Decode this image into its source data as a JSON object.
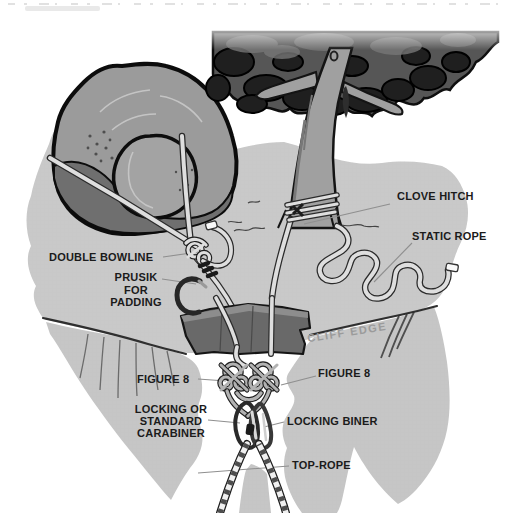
{
  "figure": {
    "labels": {
      "clove_hitch": "CLOVE HITCH",
      "static_rope": "STATIC ROPE",
      "double_bowline": "DOUBLE BOWLINE",
      "prusik": {
        "line1": "PRUSIK",
        "line2": "FOR",
        "line3": "PADDING"
      },
      "cliff_edge": "CLIFF EDGE",
      "figure8_left": "FIGURE 8",
      "figure8_right": "FIGURE 8",
      "carabiner": {
        "line1": "LOCKING OR",
        "line2": "STANDARD",
        "line3": "CARABINER"
      },
      "locking_biner": "LOCKING BINER",
      "top_rope": "TOP-ROPE"
    }
  },
  "colors": {
    "background": "#ffffff",
    "ground": "#c9c9c9",
    "cliff": "#c6c6c6",
    "boulder": "#9b9b9b",
    "boulder_shadow": "#6f6f6f",
    "boulder_lobe": "#a3a3a3",
    "canopy": "#565656",
    "canopy_dark": "#1f1f1f",
    "trunk": "#a0a0a0",
    "pad": "#696969",
    "pad_top": "#8f8f8f",
    "rope": "#dedede",
    "rope_outline": "#2b2b2b",
    "label_text": "#1b1b1b",
    "cliff_edge_text": "#9b9b9b",
    "leader_line": "#8f8f8f",
    "edge_line": "#2f2f2f"
  }
}
